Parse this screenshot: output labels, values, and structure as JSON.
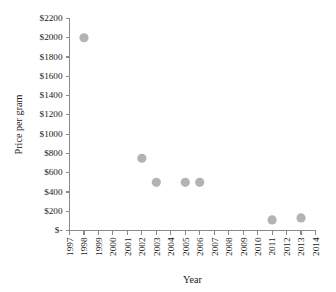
{
  "chart_data": {
    "type": "scatter",
    "title": "",
    "xlabel": "Year",
    "ylabel": "Price per gram",
    "grid": false,
    "legend": false,
    "marker_color": "#b3b3b3",
    "axis_color": "#8a8a8a",
    "background": "#ffffff",
    "xlim": [
      1997,
      2014
    ],
    "ylim": [
      0,
      2200
    ],
    "x_tick_labels": [
      "1997",
      "1998",
      "1999",
      "2000",
      "2001",
      "2002",
      "2003",
      "2004",
      "2005",
      "2006",
      "2007",
      "2008",
      "2009",
      "2010",
      "2011",
      "2012",
      "2013",
      "2014"
    ],
    "x_tick_values": [
      1997,
      1998,
      1999,
      2000,
      2001,
      2002,
      2003,
      2004,
      2005,
      2006,
      2007,
      2008,
      2009,
      2010,
      2011,
      2012,
      2013,
      2014
    ],
    "y_tick_labels": [
      "$-",
      "$200",
      "$400",
      "$600",
      "$800",
      "$1000",
      "$1200",
      "$1400",
      "$1600",
      "$1800",
      "$2000",
      "$2200"
    ],
    "y_tick_values": [
      0,
      200,
      400,
      600,
      800,
      1000,
      1200,
      1400,
      1600,
      1800,
      2000,
      2200
    ],
    "points": [
      {
        "x": 1998,
        "y": 2000
      },
      {
        "x": 2002,
        "y": 750
      },
      {
        "x": 2003,
        "y": 500
      },
      {
        "x": 2005,
        "y": 500
      },
      {
        "x": 2006,
        "y": 500
      },
      {
        "x": 2011,
        "y": 110
      },
      {
        "x": 2013,
        "y": 130
      }
    ]
  }
}
